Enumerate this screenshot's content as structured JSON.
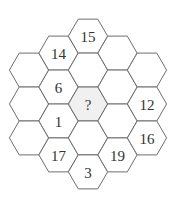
{
  "puzzle": {
    "type": "hexagonal-number-grid",
    "colors": {
      "stroke": "#6e6e6e",
      "fill": "#ffffff",
      "highlight_fill": "#f0f0f0",
      "text": "#333333"
    },
    "columns": [
      {
        "cells": [
          "",
          "",
          ""
        ]
      },
      {
        "cells": [
          "14",
          "6",
          "1",
          "17"
        ]
      },
      {
        "cells": [
          "15",
          "",
          "?",
          "",
          "3"
        ]
      },
      {
        "cells": [
          "",
          "",
          "",
          "19"
        ]
      },
      {
        "cells": [
          "",
          "12",
          "16"
        ]
      }
    ],
    "highlighted_cell": {
      "column": 2,
      "row": 2,
      "label": "?"
    }
  }
}
